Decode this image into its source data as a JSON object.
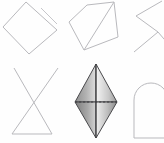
{
  "canvas": {
    "width": 164,
    "height": 143,
    "background": "#fefefe",
    "description": "Grid of six small geometric shape thumbnails, three across and two down"
  },
  "palette": {
    "wireframe_stroke": "#b9b9bd",
    "wireframe_stroke_light": "#c6c6ca",
    "solid_edge": "#4a4a4d",
    "dashed_line": "#3d3d40",
    "shade_light": "#f2f2f2",
    "shade_mid": "#a9a9a9",
    "shade_dark": "#6e6e6e"
  },
  "grid": {
    "columns": 3,
    "rows": 2
  },
  "shapes": [
    {
      "id": "shape-1",
      "name": "tilted-quadrilateral",
      "label": "Tilted quadrilateral outline with stray edge",
      "style": "wireframe",
      "row": 1,
      "column": 1,
      "vertices": [
        [
          26,
          2
        ],
        [
          57,
          30
        ],
        [
          29,
          54
        ],
        [
          3,
          27
        ]
      ],
      "extra_segments": [
        [
          [
            41,
            8
          ],
          [
            57,
            24
          ]
        ]
      ]
    },
    {
      "id": "shape-2",
      "name": "pentagon-with-diagonal",
      "label": "Pentagon outline with interior diagonal",
      "style": "wireframe",
      "row": 1,
      "column": 2,
      "vertices": [
        [
          21,
          5
        ],
        [
          48,
          2
        ],
        [
          52,
          37
        ],
        [
          18,
          50
        ],
        [
          3,
          22
        ]
      ],
      "extra_segments": [
        [
          [
            18,
            50
          ],
          [
            48,
            2
          ]
        ]
      ]
    },
    {
      "id": "shape-3",
      "name": "zigzag-chevron-clipped",
      "label": "Angular zigzag shape clipped by the right edge",
      "style": "wireframe",
      "row": 1,
      "column": 3,
      "vertices": [
        [
          34,
          1
        ],
        [
          8,
          16
        ],
        [
          30,
          32
        ],
        [
          6,
          52
        ]
      ],
      "extra_segments": [
        [
          [
            30,
            32
          ],
          [
            40,
            44
          ]
        ]
      ]
    },
    {
      "id": "shape-4",
      "name": "triangle-with-crossed-apex",
      "label": "Triangle whose two sides cross above the apex",
      "style": "wireframe",
      "row": 2,
      "column": 1,
      "extra_segments": [
        [
          [
            12,
            72
          ],
          [
            58,
            6
          ]
        ],
        [
          [
            52,
            72
          ],
          [
            14,
            6
          ]
        ],
        [
          [
            12,
            72
          ],
          [
            52,
            72
          ]
        ]
      ]
    },
    {
      "id": "shape-5",
      "name": "shaded-bipyramid",
      "label": "Shaded three-dimensional bipyramid with dashed equator",
      "style": "shaded-3d",
      "row": 2,
      "column": 2,
      "apex_top": [
        22,
        2
      ],
      "apex_bottom": [
        22,
        76
      ],
      "equator_left": [
        1,
        40
      ],
      "equator_right": [
        43,
        40
      ],
      "has_dashed_equator": true,
      "has_center_line": true
    },
    {
      "id": "shape-6",
      "name": "arch-outline-clipped",
      "label": "Arch / rounded-top rectangle clipped by the right edge",
      "style": "wireframe",
      "row": 2,
      "column": 3
    }
  ]
}
